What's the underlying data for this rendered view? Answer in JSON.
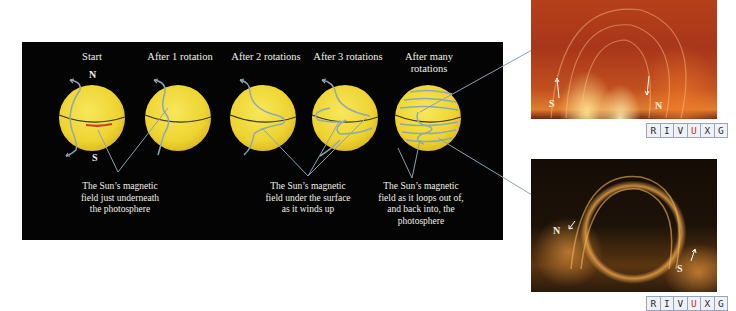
{
  "stages": [
    {
      "label": "Start",
      "cx": 92
    },
    {
      "label": "After 1 rotation",
      "cx": 178
    },
    {
      "label": "After 2 rotations",
      "cx": 263
    },
    {
      "label": "After 3 rotations",
      "cx": 345
    },
    {
      "label": "After many rotations",
      "line1": "After many",
      "line2": "rotations",
      "cx": 428
    }
  ],
  "poles": {
    "north": "N",
    "south": "S"
  },
  "captions": [
    {
      "lines": [
        "The Sun’s magnetic",
        "field just underneath",
        "the photosphere"
      ]
    },
    {
      "lines": [
        "The Sun’s magnetic",
        "field under the surface",
        "as it winds up"
      ]
    },
    {
      "lines": [
        "The Sun’s magnetic",
        "field as it loops out of,",
        "and back into, the",
        "photosphere"
      ]
    }
  ],
  "photos": [
    {
      "name": "top",
      "labels": {
        "south": "S",
        "north": "N"
      }
    },
    {
      "name": "bottom",
      "labels": {
        "north": "N",
        "south": "S"
      }
    }
  ],
  "wavebands": [
    "R",
    "I",
    "V",
    "U",
    "X",
    "G"
  ],
  "active_waveband": "U",
  "colors": {
    "sun": "#f1d93a",
    "field_line": "#8fa8b4",
    "equator": "#3a3a14",
    "panel": "#040404",
    "leader_line": "#8aa2b0"
  }
}
